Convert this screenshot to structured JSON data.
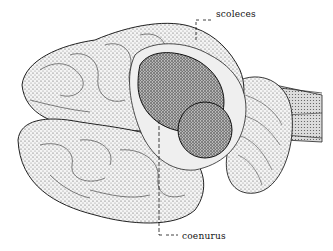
{
  "figure": {
    "labels": {
      "scoleces": "scoleces",
      "coenurus": "coenurus"
    },
    "colors": {
      "ink": "#111111",
      "paper": "#ffffff",
      "stipple": "#555555"
    }
  }
}
